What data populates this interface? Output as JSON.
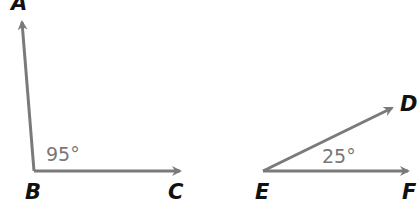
{
  "diagram": {
    "angle1": {
      "vertex": "B",
      "arm1_end": "A",
      "arm2_end": "C",
      "measure": "95°"
    },
    "angle2": {
      "vertex": "E",
      "arm1_end": "D",
      "arm2_end": "F",
      "measure": "25°"
    },
    "colors": {
      "ray": "#7a7a7a",
      "label": "#111111",
      "measure": "#777777"
    }
  }
}
